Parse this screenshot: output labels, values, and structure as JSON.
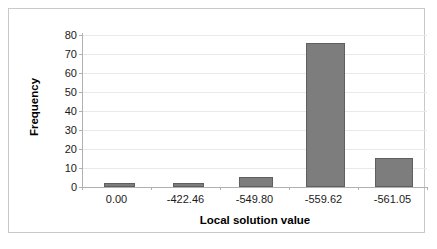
{
  "chart_data": {
    "type": "bar",
    "title": "",
    "xlabel": "Local solution value",
    "ylabel": "Frequency",
    "categories": [
      "0.00",
      "-422.46",
      "-549.80",
      "-559.62",
      "-561.05"
    ],
    "values": [
      2,
      2,
      5,
      76,
      15
    ],
    "yticks": [
      0,
      10,
      20,
      30,
      40,
      50,
      60,
      70,
      80
    ],
    "ytick_labels": [
      "0",
      "10",
      "20",
      "30",
      "40",
      "50",
      "60",
      "70",
      "80"
    ],
    "ylim": [
      0,
      80
    ],
    "grid": true,
    "legend": "none",
    "series": [
      {
        "name": "Frequency",
        "values": [
          2,
          2,
          5,
          76,
          15
        ],
        "color": "#7d7d7d",
        "edge_color": "#5f5f5f"
      }
    ],
    "colors": {
      "bar_fill": "#7d7d7d",
      "bar_edge": "#5f5f5f",
      "gridline": "#e9e9e9",
      "axis": "#b0b0b0",
      "text": "#1a1a1a",
      "frame_border": "#c9c9c9",
      "background": "#ffffff"
    }
  }
}
